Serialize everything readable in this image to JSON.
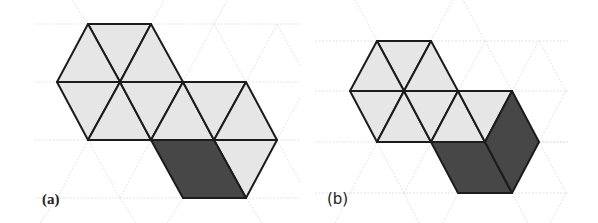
{
  "figure": {
    "colors": {
      "light_fill": "#e6e6e6",
      "dark_fill": "#474747",
      "stroke": "#1c1c1c",
      "grid": "#dcdcdc",
      "background": "#ffffff"
    },
    "panels": [
      {
        "id": "a",
        "label": "(a)",
        "grid_rows_y": [
          24,
          82,
          140,
          198
        ],
        "light_triangles": 11,
        "dark_rhombi": 1
      },
      {
        "id": "b",
        "label": "(b)",
        "grid_rows_y": [
          41,
          91,
          142,
          193
        ],
        "light_triangles": 9,
        "dark_rhombi": 2
      }
    ]
  }
}
